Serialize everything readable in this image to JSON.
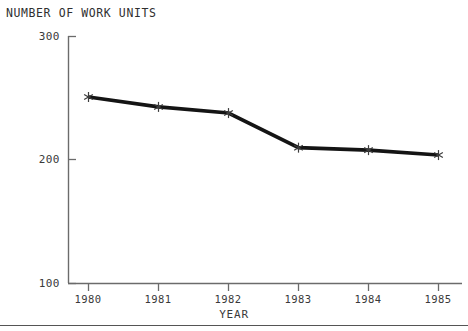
{
  "chart_data": {
    "type": "line",
    "title": "NUMBER OF WORK UNITS",
    "xlabel": "YEAR",
    "ylabel": "",
    "categories": [
      "1980",
      "1981",
      "1982",
      "1983",
      "1984",
      "1985"
    ],
    "values": [
      251,
      243,
      238,
      210,
      208,
      204
    ],
    "series": [
      {
        "name": "NUMBER OF WORK UNITS",
        "values": [
          251,
          243,
          238,
          210,
          208,
          204
        ]
      }
    ],
    "ylim": [
      100,
      300
    ],
    "yticks": [
      "300",
      "200",
      "100"
    ],
    "ytick_values": [
      300,
      200,
      100
    ],
    "xticks": [
      "1980",
      "1981",
      "1982",
      "1983",
      "1984",
      "1985"
    ],
    "grid": false,
    "legend": "none",
    "marker": "asterisk",
    "line_color": "#1a1a1a",
    "axis_color": "#6b6b6b",
    "background": "#ffffff"
  },
  "figure": {
    "title": "NUMBER OF WORK UNITS",
    "xaxis_title": "YEAR",
    "ytick_labels": [
      "300",
      "200",
      "100"
    ],
    "xtick_labels": [
      "1980",
      "1981",
      "1982",
      "1983",
      "1984",
      "1985"
    ]
  }
}
